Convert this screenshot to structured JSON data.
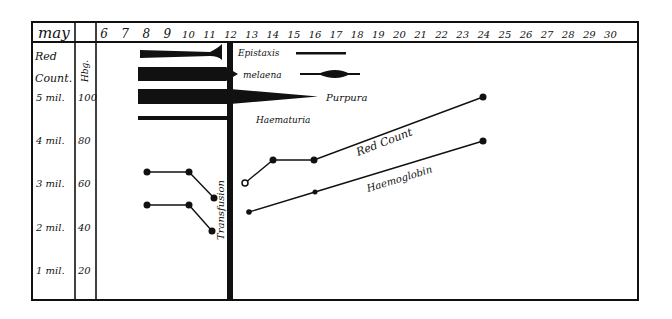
{
  "chart_data": {
    "type": "line",
    "title": "",
    "header": {
      "month_label": "may",
      "hb_label": "Hbg."
    },
    "xlabel": "Day of May",
    "x": [
      6,
      7,
      8,
      9,
      10,
      11,
      12,
      13,
      14,
      15,
      16,
      17,
      18,
      19,
      20,
      21,
      22,
      23,
      24,
      25,
      26,
      27,
      28,
      29,
      30
    ],
    "y_axes": {
      "red_count": {
        "label": "Red Count.",
        "ticks": [
          "5 mil",
          "4 mil",
          "3 mil",
          "2 mil",
          "1 mil"
        ]
      },
      "haemoglobin": {
        "label": "Hbg.",
        "ticks": [
          100,
          80,
          60,
          40,
          20
        ]
      }
    },
    "ylim": [
      10,
      105
    ],
    "series": [
      {
        "name": "Red Count",
        "unit": "millions",
        "points": [
          {
            "day": 8,
            "value": 3.3
          },
          {
            "day": 10,
            "value": 3.3
          },
          {
            "day": 11.2,
            "value": 2.7
          },
          {
            "day": 12.7,
            "value": 3.05
          },
          {
            "day": 14,
            "value": 3.55
          },
          {
            "day": 16,
            "value": 3.55
          },
          {
            "day": 24,
            "value": 5.0
          }
        ]
      },
      {
        "name": "Haemoglobin",
        "unit": "percent",
        "points": [
          {
            "day": 8,
            "value": 51
          },
          {
            "day": 10,
            "value": 51
          },
          {
            "day": 11.1,
            "value": 39
          },
          {
            "day": 12.9,
            "value": 48
          },
          {
            "day": 16,
            "value": 57
          },
          {
            "day": 24,
            "value": 80
          }
        ]
      }
    ],
    "symptom_bars": [
      {
        "name": "Epistaxis",
        "label": "Epistaxis",
        "start_day": 8,
        "end_day": 17.5,
        "note": "tapering, ends around day 11 then thin line days 15-17"
      },
      {
        "name": "Melaena",
        "label": "melaena",
        "start_day": 8,
        "end_day": 18.5,
        "note": "heavy days 8-12, spindle peak around day 17"
      },
      {
        "name": "Purpura",
        "label": "Purpura",
        "start_day": 8,
        "end_day": 15.5,
        "note": "heavy, tapering after day 12"
      },
      {
        "name": "Haematuria",
        "label": "Haematuria",
        "start_day": 8,
        "end_day": 12,
        "note": "thin line"
      }
    ],
    "annotations": [
      {
        "text": "Transfusion",
        "day": 12,
        "orientation": "vertical"
      },
      {
        "text": "Red Count",
        "near": "red count line"
      },
      {
        "text": "Haemoglobin",
        "near": "haemoglobin line"
      }
    ],
    "grid": false,
    "legend": "none (inline labels)"
  }
}
